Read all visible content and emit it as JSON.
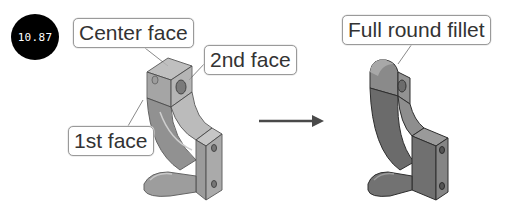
{
  "badge": {
    "text": "10.87"
  },
  "before": {
    "labels": {
      "center_face": "Center face",
      "second_face": "2nd face",
      "first_face": "1st face"
    }
  },
  "after": {
    "labels": {
      "full_round_fillet": "Full round fillet"
    }
  },
  "colors": {
    "badge_bg": "#000000",
    "badge_text": "#ffffff",
    "label_border": "#9a9a9a",
    "label_text": "#333333",
    "part_transparent": "#8e8e8e",
    "part_solid": "#6f6f6f",
    "arrow": "#4a4a4a"
  }
}
